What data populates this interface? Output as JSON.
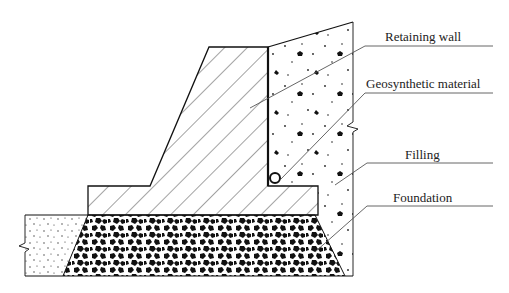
{
  "diagram": {
    "type": "retaining-wall-cross-section",
    "labels": [
      {
        "id": "retaining_wall",
        "text": "Retaining wall"
      },
      {
        "id": "geosynthetic",
        "text": "Geosynthetic material"
      },
      {
        "id": "filling",
        "text": "Filling"
      },
      {
        "id": "foundation",
        "text": "Foundation"
      }
    ],
    "colors": {
      "line": "#111111",
      "leader": "#555555",
      "background": "#ffffff"
    }
  }
}
